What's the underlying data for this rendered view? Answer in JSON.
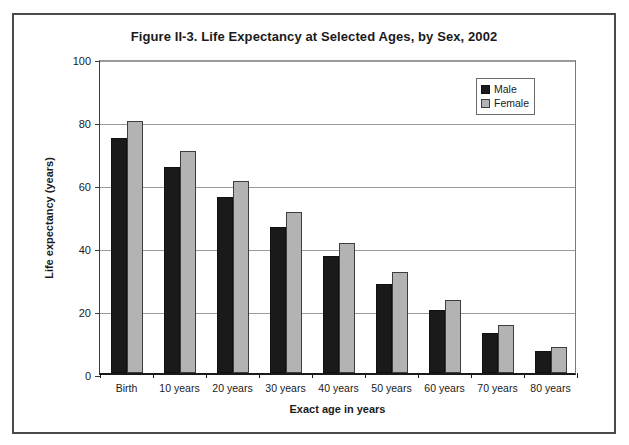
{
  "chart_data": {
    "type": "bar",
    "title": "Figure II-3. Life Expectancy at Selected Ages, by Sex, 2002",
    "xlabel": "Exact age in years",
    "ylabel": "Life expectancy (years)",
    "categories": [
      "Birth",
      "10 years",
      "20 years",
      "30 years",
      "40 years",
      "50 years",
      "60 years",
      "70 years",
      "80 years"
    ],
    "series": [
      {
        "name": "Male",
        "color": "#1a1a1a",
        "values": [
          74.5,
          65.3,
          55.8,
          46.3,
          37.0,
          28.2,
          20.0,
          12.6,
          7.0
        ]
      },
      {
        "name": "Female",
        "color": "#b3b3b3",
        "values": [
          79.9,
          70.6,
          60.8,
          51.1,
          41.4,
          32.1,
          23.2,
          15.2,
          8.4
        ]
      }
    ],
    "ylim": [
      0,
      100
    ],
    "yticks": [
      0,
      20,
      40,
      60,
      80,
      100
    ],
    "ytick_labels": [
      "0",
      "20",
      "40",
      "60",
      "80",
      "100"
    ],
    "grid": true,
    "legend_position": "top-right"
  },
  "legend": {
    "entries": [
      {
        "label": "Male"
      },
      {
        "label": "Female"
      }
    ]
  }
}
